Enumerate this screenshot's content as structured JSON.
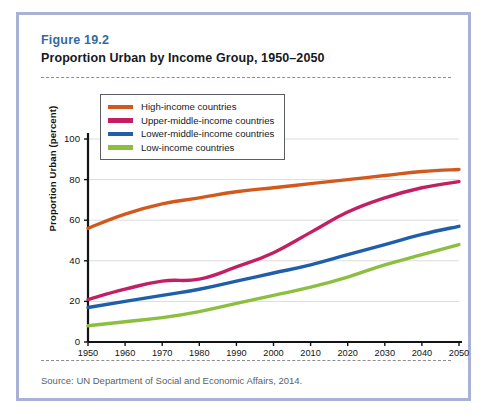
{
  "figure": {
    "number": "Figure 19.2",
    "title": "Proportion Urban by Income Group, 1950–2050",
    "source": "Source: UN Department of Social and Economic Affairs, 2014.",
    "frame_color": "#a9b1d6",
    "number_color": "#2f6ca3"
  },
  "chart_data": {
    "type": "line",
    "title": "Proportion Urban by Income Group, 1950–2050",
    "xlabel": "",
    "ylabel": "Proportion Urban (percent)",
    "xlim": [
      1950,
      2050
    ],
    "ylim": [
      0,
      100
    ],
    "xticks": [
      1950,
      1960,
      1970,
      1980,
      1990,
      2000,
      2010,
      2020,
      2030,
      2040,
      2050
    ],
    "yticks": [
      0,
      20,
      40,
      60,
      80,
      100
    ],
    "grid": "horizontal",
    "legend_position": "top-left inside",
    "x": [
      1950,
      1960,
      1970,
      1980,
      1990,
      2000,
      2010,
      2020,
      2030,
      2040,
      2050
    ],
    "series": [
      {
        "name": "High-income countries",
        "color": "#d2591e",
        "values": [
          56,
          63,
          68,
          71,
          74,
          76,
          78,
          80,
          82,
          84,
          85
        ]
      },
      {
        "name": "Upper-middle-income countries",
        "color": "#c22063",
        "values": [
          21,
          26,
          30,
          31,
          37,
          44,
          54,
          64,
          71,
          76,
          79
        ]
      },
      {
        "name": "Lower-middle-income countries",
        "color": "#1f5fa9",
        "values": [
          17,
          20,
          23,
          26,
          30,
          34,
          38,
          43,
          48,
          53,
          57
        ]
      },
      {
        "name": "Low-income countries",
        "color": "#8cbf3f",
        "values": [
          8,
          10,
          12,
          15,
          19,
          23,
          27,
          32,
          38,
          43,
          48
        ]
      }
    ]
  },
  "legend": {
    "items": [
      {
        "label": "High-income countries",
        "color": "#d2591e"
      },
      {
        "label": "Upper-middle-income countries",
        "color": "#c22063"
      },
      {
        "label": "Lower-middle-income countries",
        "color": "#1f5fa9"
      },
      {
        "label": "Low-income countries",
        "color": "#8cbf3f"
      }
    ]
  }
}
